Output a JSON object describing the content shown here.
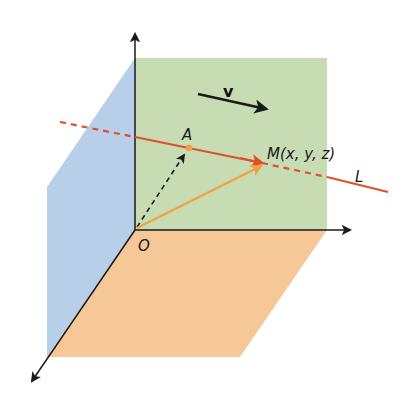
{
  "figure": {
    "colors": {
      "background": "#ffffff",
      "plane_yz": "#b8cfe9",
      "plane_xz": "#c8dcb4",
      "plane_xy": "#f6c898",
      "axis": "#1a1a1a",
      "line_L": "#e0502a",
      "position_vector_M": "#f0a040",
      "position_vector_A": "#1a1a1a",
      "point_A": "#f0a040"
    },
    "labels": {
      "origin": "O",
      "point_a": "A",
      "point_m": "M(x, y, z)",
      "line": "L",
      "direction_vector": "v"
    },
    "elements": {
      "axes": [
        "vertical-axis",
        "horizontal-axis",
        "depth-axis"
      ],
      "planes": [
        "blue-left-plane",
        "green-back-plane",
        "orange-floor-plane"
      ],
      "vectors": [
        "OA (dashed black)",
        "OM (orange)",
        "v (black direction)"
      ],
      "line": "L (red, dashed outside the green plane region)"
    }
  }
}
